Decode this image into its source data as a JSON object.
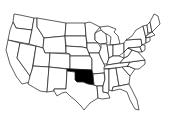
{
  "map": {
    "type": "us-states-outline",
    "highlighted_state": "Oklahoma",
    "highlight_color": "#000000",
    "fill_color": "#ffffff",
    "stroke_color": "#1a1a1a",
    "background": "#ffffff"
  }
}
